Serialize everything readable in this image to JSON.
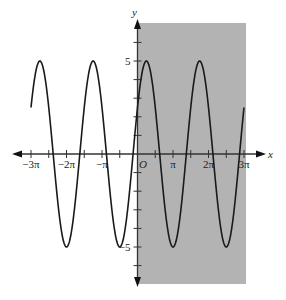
{
  "chart_data": {
    "type": "line",
    "title": "",
    "xlabel": "x",
    "ylabel": "y",
    "origin_label": "O",
    "function_description": "Sinusoid with amplitude 5 and period 3π/2 (peaks at y=5, troughs at y=-5)",
    "xlim_pi": [
      -3.4,
      3.4
    ],
    "ylim": [
      -7,
      7.5
    ],
    "x_ticks": [
      {
        "value_pi": -3,
        "label": "−3π"
      },
      {
        "value_pi": -2.5,
        "label": ""
      },
      {
        "value_pi": -2,
        "label": "−2π"
      },
      {
        "value_pi": -1.5,
        "label": ""
      },
      {
        "value_pi": -1,
        "label": "−π"
      },
      {
        "value_pi": -0.5,
        "label": ""
      },
      {
        "value_pi": 0.5,
        "label": ""
      },
      {
        "value_pi": 1,
        "label": "π"
      },
      {
        "value_pi": 1.5,
        "label": ""
      },
      {
        "value_pi": 2,
        "label": "2π"
      },
      {
        "value_pi": 2.5,
        "label": ""
      },
      {
        "value_pi": 3,
        "label": "3π"
      }
    ],
    "y_ticks": [
      {
        "value": 6,
        "label": ""
      },
      {
        "value": 5,
        "label": "5"
      },
      {
        "value": 4,
        "label": ""
      },
      {
        "value": 3,
        "label": ""
      },
      {
        "value": 2,
        "label": ""
      },
      {
        "value": 1,
        "label": ""
      },
      {
        "value": -1,
        "label": ""
      },
      {
        "value": -2,
        "label": ""
      },
      {
        "value": -3,
        "label": ""
      },
      {
        "value": -4,
        "label": ""
      },
      {
        "value": -5,
        "label": "−5"
      },
      {
        "value": -6,
        "label": ""
      }
    ],
    "series": [
      {
        "name": "curve",
        "amplitude": 5,
        "angular_frequency": 1.3333,
        "phase": 0.5236,
        "x_start_pi": -3.0,
        "x_end_pi": 3.0,
        "key_points_pi": [
          {
            "x_pi": -2.625,
            "y": 5
          },
          {
            "x_pi": -2.0,
            "y": -5
          },
          {
            "x_pi": -1.125,
            "y": 5
          },
          {
            "x_pi": -0.5,
            "y": -5
          },
          {
            "x_pi": 0.375,
            "y": 5
          },
          {
            "x_pi": 1.0,
            "y": -5
          },
          {
            "x_pi": 1.875,
            "y": 5
          },
          {
            "x_pi": 2.5,
            "y": -5
          }
        ]
      }
    ],
    "shaded_region": {
      "x_from_pi": 0,
      "x_to_pi": 3,
      "y_from": -7,
      "y_to": 7,
      "color": "#b3b3b3"
    },
    "colors": {
      "curve": "#1a1a1a",
      "axis": "#333333",
      "shade": "#b3b3b3",
      "background": "#ffffff"
    },
    "grid": false,
    "legend": null
  }
}
